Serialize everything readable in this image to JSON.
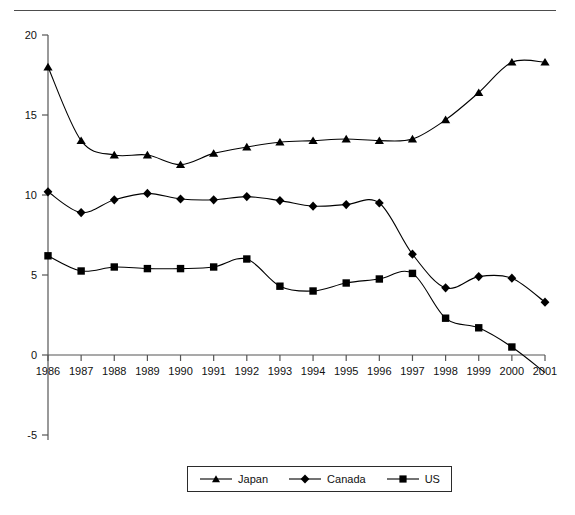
{
  "chart_data": {
    "type": "line",
    "title": "",
    "subtitle": "",
    "xlabel": "",
    "ylabel": "",
    "x": [
      1986,
      1987,
      1988,
      1989,
      1990,
      1991,
      1992,
      1993,
      1994,
      1995,
      1996,
      1997,
      1998,
      1999,
      2000,
      2001
    ],
    "categories": [
      "1986",
      "1987",
      "1988",
      "1989",
      "1990",
      "1991",
      "1992",
      "1993",
      "1994",
      "1995",
      "1996",
      "1997",
      "1998",
      "1999",
      "2000",
      "2001"
    ],
    "xlim": [
      1986,
      2001
    ],
    "ylim": [
      -5,
      20
    ],
    "yticks": [
      -5,
      0,
      5,
      10,
      15,
      20
    ],
    "ytick_labels": [
      "-5",
      "0",
      "5",
      "10",
      "15",
      "20"
    ],
    "grid": false,
    "legend_position": "bottom",
    "series": [
      {
        "name": "Japan",
        "marker": "triangle",
        "color": "#000000",
        "values": [
          18.0,
          13.4,
          12.5,
          12.5,
          11.9,
          12.6,
          13.0,
          13.3,
          13.4,
          13.5,
          13.4,
          13.5,
          14.7,
          16.4,
          18.3,
          18.3
        ]
      },
      {
        "name": "Canada",
        "marker": "diamond",
        "color": "#000000",
        "values": [
          10.2,
          8.9,
          9.7,
          10.1,
          9.75,
          9.7,
          9.9,
          9.65,
          9.3,
          9.4,
          9.5,
          6.3,
          4.2,
          4.9,
          4.8,
          3.3
        ]
      },
      {
        "name": "US",
        "marker": "square",
        "color": "#000000",
        "values": [
          6.2,
          5.25,
          5.5,
          5.4,
          5.4,
          5.5,
          6.0,
          4.3,
          4.0,
          4.5,
          4.75,
          5.1,
          2.3,
          1.7,
          0.5,
          -1.1
        ]
      }
    ]
  },
  "legend": {
    "entries": [
      {
        "label": "Japan",
        "marker": "triangle"
      },
      {
        "label": "Canada",
        "marker": "diamond"
      },
      {
        "label": "US",
        "marker": "square"
      }
    ]
  },
  "axis": {
    "y_tick_labels": [
      "20",
      "15",
      "10",
      "5",
      "0",
      "-5"
    ],
    "x_tick_labels": [
      "1986",
      "1987",
      "1988",
      "1989",
      "1990",
      "1991",
      "1992",
      "1993",
      "1994",
      "1995",
      "1996",
      "1997",
      "1998",
      "1999",
      "2000",
      "2001"
    ]
  },
  "colors": {
    "line": "#000000",
    "axis": "#555555",
    "rule": "#4d4d4d",
    "text": "#111111"
  }
}
